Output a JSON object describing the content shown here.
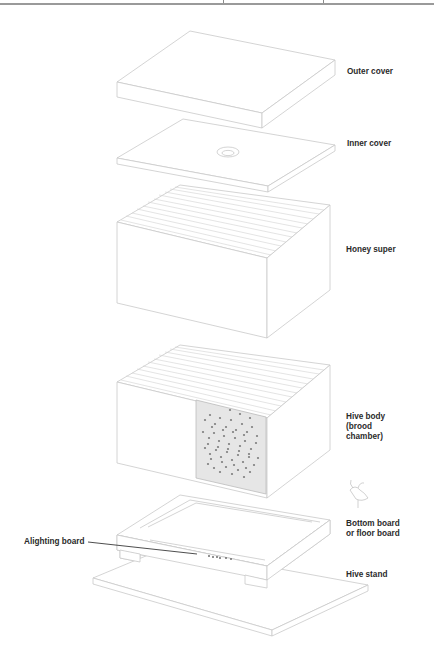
{
  "diagram": {
    "colors": {
      "line": "#c8c8c8",
      "label": "#2a2a2a",
      "brood_fill": "#e6e6e6",
      "bee": "#7a7a7a",
      "leader": "#3a3a3a",
      "top_rule": "#9a9a9a"
    },
    "labels": {
      "outer_cover": "Outer cover",
      "inner_cover": "Inner cover",
      "honey_super": "Honey super",
      "hive_body_line1": "Hive body",
      "hive_body_line2": "(brood",
      "hive_body_line3": "chamber)",
      "bottom_board_line1": "Bottom board",
      "bottom_board_line2": "or floor board",
      "hive_stand": "Hive stand",
      "alighting_board": "Alighting board"
    },
    "components": [
      "Outer cover",
      "Inner cover",
      "Honey super",
      "Hive body (brood chamber)",
      "Bottom board or floor board",
      "Hive stand",
      "Alighting board"
    ]
  }
}
